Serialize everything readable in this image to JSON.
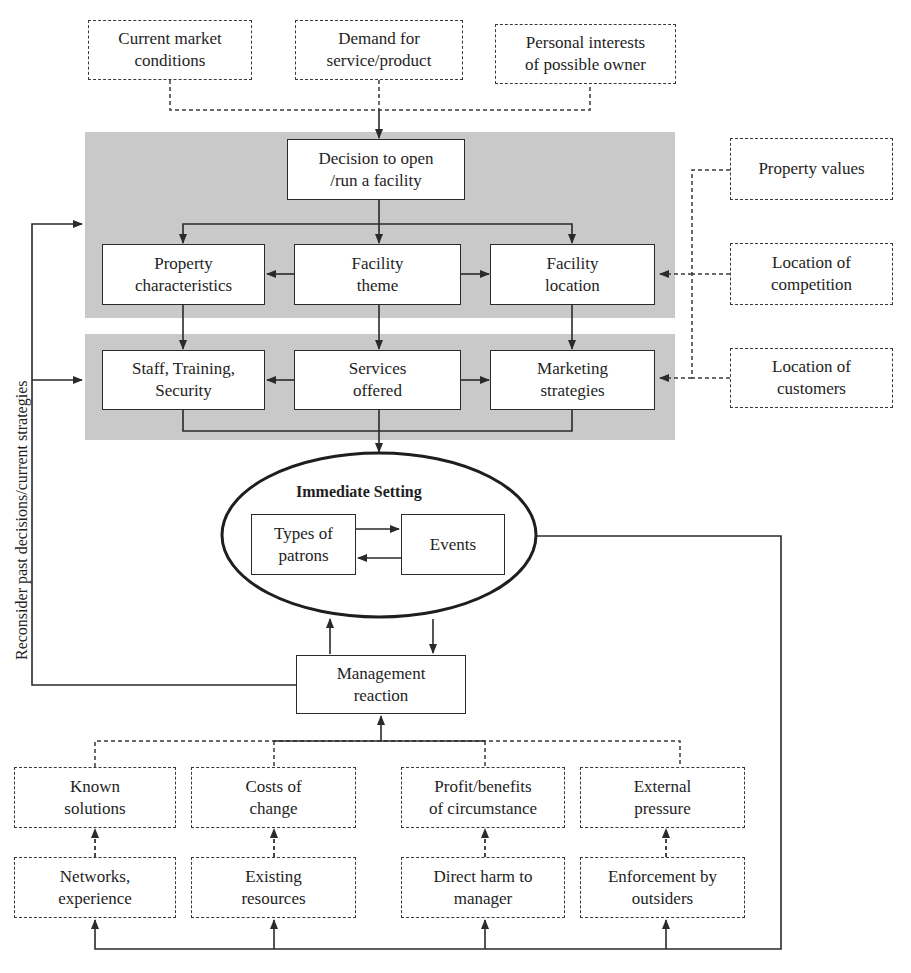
{
  "colors": {
    "panel_fill": "#c9c9c9",
    "line": "#2a2a2a",
    "box_fill": "#ffffff"
  },
  "top_inputs": [
    {
      "label": "Current market\nconditions"
    },
    {
      "label": "Demand for\nservice/product"
    },
    {
      "label": "Personal interests\nof possible owner"
    }
  ],
  "panel1": {
    "decision": "Decision to open\n/run a facility",
    "row": [
      "Property\ncharacteristics",
      "Facility\ntheme",
      "Facility\nlocation"
    ]
  },
  "panel2": {
    "row": [
      "Staff, Training,\nSecurity",
      "Services\noffered",
      "Marketing\nstrategies"
    ]
  },
  "right_inputs": [
    "Property values",
    "Location of\ncompetition",
    "Location of\ncustomers"
  ],
  "immediate_setting": {
    "title": "Immediate Setting",
    "left_box": "Types of\npatrons",
    "right_box": "Events"
  },
  "management": "Management\nreaction",
  "feedback_label": "Reconsider past decisions/current strategies",
  "factors_row1": [
    "Known\nsolutions",
    "Costs of\nchange",
    "Profit/benefits\nof circumstance",
    "External\npressure"
  ],
  "factors_row2": [
    "Networks,\nexperience",
    "Existing\nresources",
    "Direct harm to\nmanager",
    "Enforcement by\noutsiders"
  ],
  "caption_fragment": "Source: ..."
}
